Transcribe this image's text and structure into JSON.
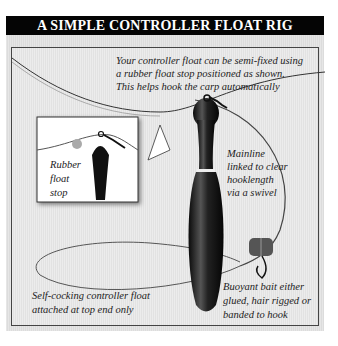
{
  "title": "A SIMPLE CONTROLLER FLOAT RIG",
  "annotations": {
    "top": [
      "Your controller float can be semi-fixed using",
      "a rubber float stop positioned as shown.",
      "This helps hook the carp automatically"
    ],
    "inset": [
      "Rubber",
      "float",
      "stop"
    ],
    "mainline": [
      "Mainline",
      "linked to clear",
      "hooklength",
      "via a swivel"
    ],
    "float": [
      "Self-cocking controller float",
      "attached at top end only"
    ],
    "bait": [
      "Buoyant bait either",
      "glued, hair rigged or",
      "banded to hook"
    ]
  },
  "colors": {
    "banner": "#050505",
    "background": "#e6e6e6",
    "float": "#1a1a1a"
  }
}
